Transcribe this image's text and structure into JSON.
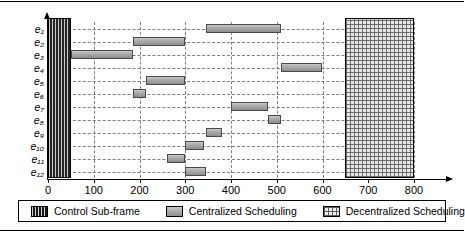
{
  "chart_data": {
    "type": "bar",
    "subtype": "gantt",
    "title": "",
    "xlabel": "",
    "ylabel": "",
    "xlim": [
      0,
      800
    ],
    "ylim_categories": [
      "e1",
      "e2",
      "e3",
      "e4",
      "e5",
      "e6",
      "e7",
      "e8",
      "e9",
      "e10",
      "e11",
      "e12"
    ],
    "xticks": [
      0,
      100,
      200,
      300,
      400,
      500,
      600,
      700,
      800
    ],
    "xtick_labels": [
      "0",
      "100",
      "200",
      "300",
      "400",
      "500",
      "600",
      "700",
      "800"
    ],
    "ytick_labels": [
      "e₁",
      "e₂",
      "e₃",
      "e₄",
      "e₅",
      "e₆",
      "e₇",
      "e₈",
      "e₉",
      "e₁₀",
      "e₁₁",
      "e₁₂"
    ],
    "grid": true,
    "grid_style": "dashed",
    "legend_position": "bottom",
    "regions": [
      {
        "name": "Control Sub-frame",
        "category": "control-sub-frame",
        "start": 0,
        "end": 50,
        "spans_all_rows": true
      },
      {
        "name": "Decentralized Scheduling",
        "category": "decentralized-scheduling",
        "start": 650,
        "end": 800,
        "spans_all_rows": true
      }
    ],
    "series": [
      {
        "name": "Centralized Scheduling",
        "category": "centralized-scheduling",
        "tasks": [
          {
            "row": "e₁",
            "row_index": 0,
            "start": 345,
            "end": 510
          },
          {
            "row": "e₂",
            "row_index": 1,
            "start": 185,
            "end": 300
          },
          {
            "row": "e₃",
            "row_index": 2,
            "start": 50,
            "end": 185
          },
          {
            "row": "e₄",
            "row_index": 3,
            "start": 510,
            "end": 600
          },
          {
            "row": "e₅",
            "row_index": 4,
            "start": 215,
            "end": 300
          },
          {
            "row": "e₆",
            "row_index": 5,
            "start": 185,
            "end": 215
          },
          {
            "row": "e₇",
            "row_index": 6,
            "start": 400,
            "end": 480
          },
          {
            "row": "e₈",
            "row_index": 7,
            "start": 480,
            "end": 510
          },
          {
            "row": "e₉",
            "row_index": 8,
            "start": 345,
            "end": 380
          },
          {
            "row": "e₁₀",
            "row_index": 9,
            "start": 300,
            "end": 340
          },
          {
            "row": "e₁₁",
            "row_index": 10,
            "start": 260,
            "end": 300
          },
          {
            "row": "e₁₂",
            "row_index": 11,
            "start": 300,
            "end": 345
          }
        ]
      }
    ],
    "legend": [
      {
        "label": "Control Sub-frame",
        "swatch": "control-sub-frame"
      },
      {
        "label": "Centralized Scheduling",
        "swatch": "centralized-scheduling"
      },
      {
        "label": "Decentralized Scheduling",
        "swatch": "decentralized-scheduling"
      }
    ],
    "colors": {
      "control_fill": "#262626",
      "centralized_fill": "#a8a8a8",
      "decentralized_fill": "#e8e8e8",
      "grid": "#808080",
      "axis": "#000000"
    }
  }
}
